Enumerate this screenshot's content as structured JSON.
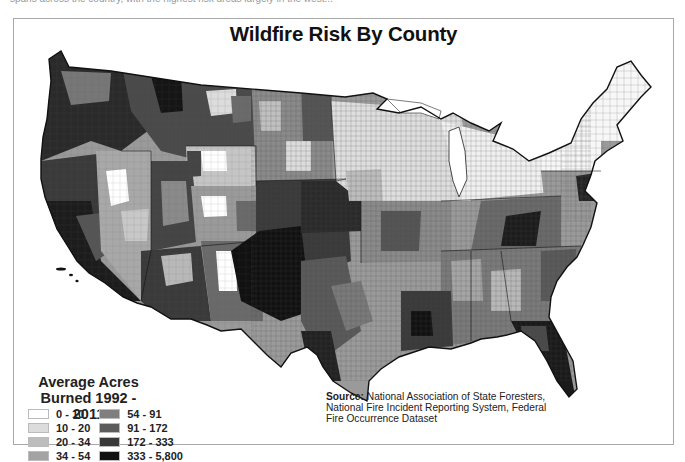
{
  "header": {
    "cropped_caption": "spans across the country, with the highest risk areas largely in the west..."
  },
  "title": "Wildfire Risk By County",
  "legend": {
    "title_line1": "Average Acres",
    "title_line2": "Burned 1992 - 2011",
    "items": [
      {
        "label": "0 - 10",
        "color": "#ffffff"
      },
      {
        "label": "10 - 20",
        "color": "#dcdcdc"
      },
      {
        "label": "20 - 34",
        "color": "#bdbdbd"
      },
      {
        "label": "34 - 54",
        "color": "#a3a3a3"
      },
      {
        "label": "54 - 91",
        "color": "#7f7f7f"
      },
      {
        "label": "91 - 172",
        "color": "#5c5c5c"
      },
      {
        "label": "172 - 333",
        "color": "#383838"
      },
      {
        "label": "333 - 5,800",
        "color": "#111111"
      }
    ]
  },
  "source": {
    "label": "Source:",
    "text": " National Association of State Foresters, National Fire Incident Reporting System, Federal Fire Occurrence Dataset"
  },
  "map": {
    "regions": [
      {
        "name": "pacific-northwest",
        "shade": 6
      },
      {
        "name": "california",
        "shade": 6
      },
      {
        "name": "nevada",
        "shade": 3
      },
      {
        "name": "idaho-montana",
        "shade": 5
      },
      {
        "name": "wyoming",
        "shade": 2
      },
      {
        "name": "utah-colorado",
        "shade": 4
      },
      {
        "name": "arizona-new-mexico",
        "shade": 5
      },
      {
        "name": "northern-plains",
        "shade": 3
      },
      {
        "name": "southern-plains-texas",
        "shade": 6
      },
      {
        "name": "midwest",
        "shade": 1
      },
      {
        "name": "great-lakes",
        "shade": 0
      },
      {
        "name": "northeast",
        "shade": 0
      },
      {
        "name": "appalachia",
        "shade": 5
      },
      {
        "name": "southeast",
        "shade": 4
      },
      {
        "name": "florida",
        "shade": 6
      },
      {
        "name": "gulf-coast",
        "shade": 5
      }
    ]
  }
}
